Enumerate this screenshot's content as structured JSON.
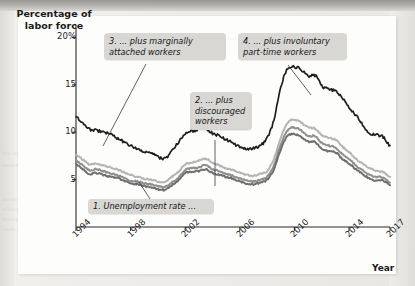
{
  "figure": {
    "y_axis_title": "Percentage of labor force",
    "x_axis_title": "Year"
  },
  "annotations": {
    "n1": "1. Unemployment rate ...",
    "n2": "2. ... plus discouraged workers",
    "n3": "3. ... plus marginally attached workers",
    "n4": "4. ... plus involuntary part-time workers"
  },
  "colors": {
    "series1": "#6f6f6f",
    "series2": "#8e8e8e",
    "series3": "#b4b4b4",
    "series4": "#1e1e1e",
    "note_bg": "#d8d7d3",
    "axis": "#2b2b2b"
  },
  "chart_data": {
    "type": "line",
    "title": "",
    "xlabel": "Year",
    "ylabel": "Percentage of labor force",
    "xlim": [
      1994,
      2017
    ],
    "ylim": [
      0,
      21
    ],
    "yticks": [
      5,
      10,
      15,
      20
    ],
    "ytick_labels": [
      "5",
      "10",
      "15",
      "20%"
    ],
    "xticks": [
      1994,
      1998,
      2002,
      2006,
      2010,
      2014,
      2017
    ],
    "xtick_labels": [
      "1994",
      "1998",
      "2002",
      "2006",
      "2010",
      "2014",
      "2017"
    ],
    "grid": false,
    "legend": "annotated-inline",
    "x": [
      1994.0,
      1994.5,
      1995.0,
      1995.5,
      1996.0,
      1996.5,
      1997.0,
      1997.5,
      1998.0,
      1998.5,
      1999.0,
      1999.5,
      2000.0,
      2000.5,
      2001.0,
      2001.5,
      2002.0,
      2002.5,
      2003.0,
      2003.5,
      2004.0,
      2004.5,
      2005.0,
      2005.5,
      2006.0,
      2006.5,
      2007.0,
      2007.5,
      2008.0,
      2008.5,
      2009.0,
      2009.5,
      2010.0,
      2010.5,
      2011.0,
      2011.5,
      2012.0,
      2012.5,
      2013.0,
      2013.5,
      2014.0,
      2014.5,
      2015.0,
      2015.5,
      2016.0,
      2016.5,
      2017.0
    ],
    "series": [
      {
        "name": "1. Unemployment rate (U-3)",
        "color": "#6f6f6f",
        "values": [
          6.6,
          6.1,
          5.6,
          5.7,
          5.5,
          5.3,
          5.2,
          4.9,
          4.6,
          4.5,
          4.3,
          4.2,
          4.0,
          3.9,
          4.4,
          4.9,
          5.7,
          5.8,
          5.9,
          6.1,
          5.7,
          5.5,
          5.3,
          5.1,
          4.8,
          4.6,
          4.5,
          4.7,
          5.0,
          6.1,
          8.2,
          9.6,
          9.8,
          9.5,
          9.0,
          9.0,
          8.3,
          8.0,
          7.9,
          7.2,
          6.7,
          6.1,
          5.6,
          5.1,
          4.9,
          4.9,
          4.4
        ]
      },
      {
        "name": "2. Plus discouraged workers (U-4)",
        "color": "#8e8e8e",
        "values": [
          7.0,
          6.5,
          6.0,
          6.1,
          5.9,
          5.7,
          5.5,
          5.2,
          4.9,
          4.8,
          4.6,
          4.5,
          4.3,
          4.2,
          4.7,
          5.2,
          6.0,
          6.2,
          6.3,
          6.5,
          6.1,
          5.9,
          5.6,
          5.4,
          5.1,
          4.9,
          4.8,
          5.0,
          5.3,
          6.5,
          8.7,
          10.2,
          10.5,
          10.2,
          9.6,
          9.6,
          8.9,
          8.6,
          8.4,
          7.7,
          7.2,
          6.5,
          6.0,
          5.5,
          5.3,
          5.2,
          4.7
        ]
      },
      {
        "name": "3. Plus marginally attached workers (U-5)",
        "color": "#b4b4b4",
        "values": [
          7.6,
          7.1,
          6.6,
          6.7,
          6.5,
          6.3,
          6.1,
          5.8,
          5.5,
          5.3,
          5.1,
          5.0,
          4.8,
          4.7,
          5.3,
          5.8,
          6.6,
          6.8,
          7.0,
          7.2,
          6.8,
          6.5,
          6.2,
          6.0,
          5.7,
          5.5,
          5.4,
          5.6,
          5.9,
          7.2,
          9.4,
          11.0,
          11.3,
          11.0,
          10.5,
          10.4,
          9.7,
          9.4,
          9.2,
          8.5,
          7.9,
          7.2,
          6.7,
          6.2,
          5.9,
          5.8,
          5.3
        ]
      },
      {
        "name": "4. Plus involuntary part-time workers (U-6)",
        "color": "#1e1e1e",
        "values": [
          11.6,
          11.0,
          10.3,
          10.2,
          10.0,
          9.8,
          9.4,
          9.0,
          8.6,
          8.3,
          8.0,
          7.8,
          7.4,
          7.2,
          8.0,
          8.9,
          9.8,
          10.1,
          10.3,
          10.4,
          9.9,
          9.6,
          9.2,
          8.9,
          8.4,
          8.2,
          8.3,
          8.6,
          9.4,
          11.3,
          14.8,
          16.7,
          16.9,
          16.6,
          15.9,
          16.0,
          14.9,
          14.6,
          14.3,
          13.6,
          12.6,
          11.8,
          10.8,
          9.9,
          9.7,
          9.5,
          8.6
        ]
      }
    ]
  }
}
